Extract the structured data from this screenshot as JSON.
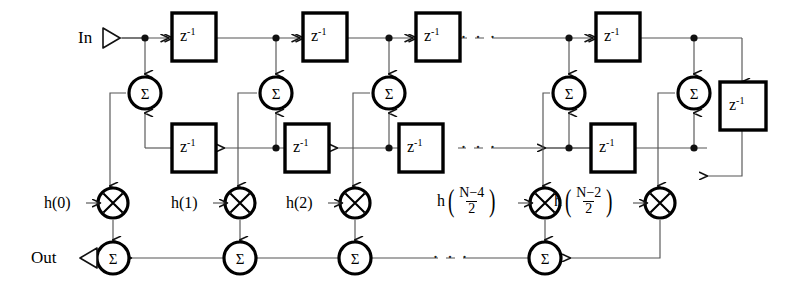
{
  "diagram": {
    "type": "signal-flow-graph",
    "io": {
      "input_label": "In",
      "output_label": "Out"
    },
    "delay_label": {
      "base": "z",
      "exponent": "-1",
      "text": "z⁻¹"
    },
    "adder_symbol": "Σ",
    "multiplier_symbol": "⊗",
    "ellipsis": "· · ·",
    "colors": {
      "line": "#555555",
      "heavy": "#000000",
      "background": "#ffffff"
    },
    "coefficients": [
      {
        "id": "h0",
        "kind": "plain",
        "text": "h(0)"
      },
      {
        "id": "h1",
        "kind": "plain",
        "text": "h(1)"
      },
      {
        "id": "h2",
        "kind": "plain",
        "text": "h(2)"
      },
      {
        "id": "hN4",
        "kind": "fraction",
        "prefix": "h",
        "numerator": "N−4",
        "denominator": "2",
        "text": "h((N−4)/2)"
      },
      {
        "id": "hN2",
        "kind": "fraction",
        "prefix": "h",
        "numerator": "N−2",
        "denominator": "2",
        "text": "h((N−2)/2)"
      }
    ],
    "columns": [
      {
        "index": 0,
        "x": 141
      },
      {
        "index": 1,
        "x": 272
      },
      {
        "index": 2,
        "x": 385
      },
      {
        "index": 3,
        "x": 565
      },
      {
        "index": 4,
        "x": 690
      }
    ],
    "rows": {
      "top_delay_line_y": 38,
      "adder_row_y": 93,
      "bottom_delay_line_y": 148,
      "multiplier_row_y": 205,
      "output_row_y": 258
    },
    "counts": {
      "top_delay_blocks": 4,
      "bottom_delay_blocks": 4,
      "extra_delay_blocks": 1,
      "adders_upper": 5,
      "multipliers": 5,
      "adders_output": 4
    }
  }
}
